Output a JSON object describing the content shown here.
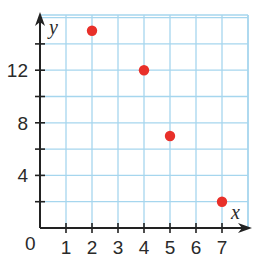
{
  "chart_data": {
    "type": "scatter",
    "title": "",
    "xlabel": "x",
    "ylabel": "y",
    "origin_label": "0",
    "xlim": [
      0,
      8
    ],
    "ylim": [
      0,
      16
    ],
    "grid": true,
    "x_ticks": [
      1,
      2,
      3,
      4,
      5,
      6,
      7
    ],
    "x_tick_labels": [
      "1",
      "2",
      "3",
      "4",
      "5",
      "6",
      "7"
    ],
    "y_ticks": [
      2,
      4,
      6,
      8,
      10,
      12,
      14
    ],
    "y_tick_labels": [
      "4",
      "8",
      "12"
    ],
    "y_labeled_values": [
      4,
      8,
      12
    ],
    "series": [
      {
        "name": "points",
        "color": "#e8302a",
        "points": [
          {
            "x": 2,
            "y": 15
          },
          {
            "x": 4,
            "y": 12
          },
          {
            "x": 5,
            "y": 7
          },
          {
            "x": 7,
            "y": 2
          }
        ]
      }
    ],
    "colors": {
      "grid": "#a6d6ee",
      "axis": "#222222",
      "point": "#e8302a"
    }
  }
}
